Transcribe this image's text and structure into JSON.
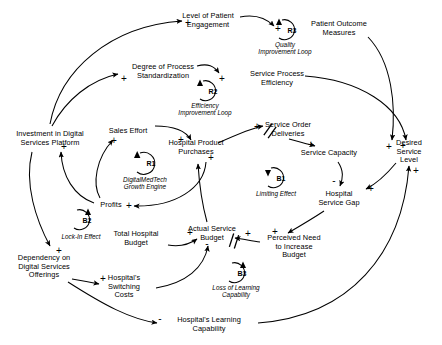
{
  "diagram": {
    "type": "causal-loop-diagram",
    "background_color": "#ffffff",
    "stroke_color": "#000000"
  },
  "nodes": [
    {
      "id": "patient_engagement",
      "label": "Level of Patient\nEngagement",
      "x": 208,
      "y": 21
    },
    {
      "id": "patient_outcome",
      "label": "Patient Outcome\nMeasures",
      "x": 339,
      "y": 29
    },
    {
      "id": "process_standardization",
      "label": "Degree of Process\nStandardization",
      "x": 163,
      "y": 72
    },
    {
      "id": "service_process_efficiency",
      "label": "Service Process\nEfficiency",
      "x": 277,
      "y": 79
    },
    {
      "id": "investment_platform",
      "label": "Investment in Digital\nServices Platform",
      "x": 50,
      "y": 139
    },
    {
      "id": "sales_effort",
      "label": "Sales Effort",
      "x": 128,
      "y": 131
    },
    {
      "id": "service_order_deliveries",
      "label": "Service Order\nDeliveries",
      "x": 288,
      "y": 130
    },
    {
      "id": "service_capacity",
      "label": "Service Capacity",
      "x": 329,
      "y": 153
    },
    {
      "id": "desired_service_level",
      "label": "Desired\nService Level",
      "x": 409,
      "y": 152
    },
    {
      "id": "hospital_product_purchases",
      "label": "Hospital Product\nPurchases",
      "x": 196,
      "y": 148
    },
    {
      "id": "hospital_service_gap",
      "label": "Hospital\nService Gap",
      "x": 339,
      "y": 199
    },
    {
      "id": "profits",
      "label": "Profits",
      "x": 111,
      "y": 205
    },
    {
      "id": "total_hospital_budget",
      "label": "Total Hospital\nBudget",
      "x": 136,
      "y": 239
    },
    {
      "id": "actual_service_budget",
      "label": "Actual Service\nBudget",
      "x": 212,
      "y": 234
    },
    {
      "id": "perceived_need_budget",
      "label": "Perceived Need\nto Increase\nBudget",
      "x": 294,
      "y": 247
    },
    {
      "id": "dependency_offerings",
      "label": "Dependency on\nDigital Services\nOfferings",
      "x": 44,
      "y": 267
    },
    {
      "id": "switching_costs",
      "label": "Hospital's\nSwitching\nCosts",
      "x": 124,
      "y": 287
    },
    {
      "id": "learning_capability",
      "label": "Hospital's Learning\nCapability",
      "x": 209,
      "y": 325
    }
  ],
  "loops": [
    {
      "id": "R1",
      "code": "R1",
      "name": "DigitalMedTech\nGrowth Engine",
      "cx": 145,
      "cy": 163,
      "name_x": 145,
      "name_y": 183,
      "direction": "clockwise"
    },
    {
      "id": "R2",
      "code": "R2",
      "name": "Efficiency\nImprovement Loop",
      "cx": 208,
      "cy": 91,
      "name_x": 205,
      "name_y": 109,
      "direction": "clockwise"
    },
    {
      "id": "R3",
      "code": "R3",
      "name": "Quality\nImprovement Loop",
      "cx": 287,
      "cy": 30,
      "name_x": 285,
      "name_y": 48,
      "direction": "clockwise"
    },
    {
      "id": "B1",
      "code": "B1",
      "name": "Limiting Effect",
      "cx": 276,
      "cy": 178,
      "name_x": 276,
      "name_y": 194,
      "direction": "counter"
    },
    {
      "id": "B2",
      "code": "B2",
      "name": "Lock-In Effect",
      "cx": 82,
      "cy": 220,
      "name_x": 81,
      "name_y": 237,
      "direction": "clockwise"
    },
    {
      "id": "B3",
      "code": "B3",
      "name": "Loss of Learning\nCapability",
      "cx": 237,
      "cy": 273,
      "name_x": 236,
      "name_y": 291,
      "direction": "clockwise"
    }
  ],
  "polarities": [
    {
      "sign": "+",
      "x": 188,
      "y": 23,
      "for": "investment-to-patient-engagement"
    },
    {
      "sign": "+",
      "x": 278,
      "y": 29,
      "for": "patient-engagement-to-patient-outcome"
    },
    {
      "sign": "+",
      "x": 124,
      "y": 79,
      "for": "investment-to-standardization"
    },
    {
      "sign": "+",
      "x": 222,
      "y": 79,
      "for": "standardization-to-efficiency"
    },
    {
      "sign": "+",
      "x": 64,
      "y": 147,
      "for": "profits-to-investment"
    },
    {
      "sign": "+",
      "x": 114,
      "y": 141,
      "for": "profits-to-sales-effort"
    },
    {
      "sign": "+",
      "x": 257,
      "y": 127,
      "for": "purchases-to-service-order-deliveries"
    },
    {
      "sign": "+",
      "x": 311,
      "y": 145,
      "for": "deliveries-to-service-capacity"
    },
    {
      "sign": "+",
      "x": 181,
      "y": 140,
      "for": "sales-effort-to-purchases"
    },
    {
      "sign": "+",
      "x": 211,
      "y": 158,
      "for": "budget-to-purchases"
    },
    {
      "sign": "+",
      "x": 129,
      "y": 206,
      "for": "purchases-to-profits"
    },
    {
      "sign": "+",
      "x": 389,
      "y": 147,
      "for": "outcome-to-desired-service-level"
    },
    {
      "sign": "+",
      "x": 403,
      "y": 146,
      "for": "efficiency-to-desired-service-level"
    },
    {
      "sign": "+",
      "x": 416,
      "y": 171,
      "for": "learning-to-desired-service-level"
    },
    {
      "sign": "-",
      "x": 334,
      "y": 181,
      "for": "service-capacity-to-gap"
    },
    {
      "sign": "+",
      "x": 371,
      "y": 189,
      "for": "desired-level-to-gap"
    },
    {
      "sign": "+",
      "x": 275,
      "y": 232,
      "for": "gap-to-perceived-need"
    },
    {
      "sign": "+",
      "x": 248,
      "y": 234,
      "for": "perceived-need-to-actual-budget"
    },
    {
      "sign": "+",
      "x": 190,
      "y": 233,
      "for": "total-budget-to-actual-budget"
    },
    {
      "sign": "-",
      "x": 207,
      "y": 244,
      "for": "switching-to-actual-budget"
    },
    {
      "sign": "+",
      "x": 59,
      "y": 251,
      "for": "investment-to-dependency"
    },
    {
      "sign": "+",
      "x": 103,
      "y": 279,
      "for": "dependency-to-switching-costs"
    },
    {
      "sign": "-",
      "x": 160,
      "y": 319,
      "for": "dependency-to-learning-capability"
    }
  ],
  "delay_marks": [
    {
      "x": 270,
      "y": 131,
      "angle": 125,
      "for": "purchases-to-deliveries-delay"
    },
    {
      "x": 234,
      "y": 242,
      "angle": 110,
      "for": "perceived-need-to-budget-delay"
    }
  ]
}
